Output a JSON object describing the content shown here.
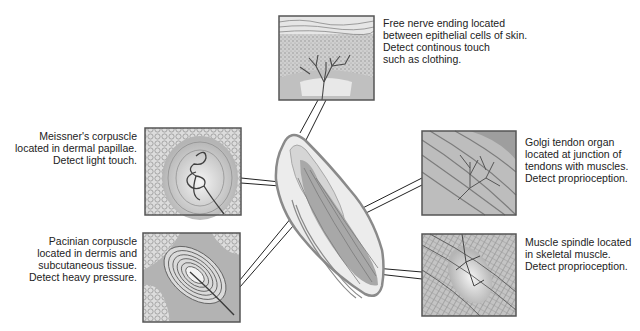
{
  "figure": {
    "receptors": [
      {
        "id": "free-nerve-ending",
        "label": "Free nerve ending located\nbetween epithelial cells of skin.\nDetect continous touch\nsuch as clothing."
      },
      {
        "id": "meissners-corpuscle",
        "label": "Meissner's corpuscle\nlocated in dermal papillae.\nDetect light touch."
      },
      {
        "id": "pacinian-corpuscle",
        "label": "Pacinian corpuscle\nlocated in dermis and\nsubcutaneous tissue.\nDetect heavy pressure."
      },
      {
        "id": "golgi-tendon-organ",
        "label": "Golgi tendon organ\nlocated at junction of\ntendons with muscles.\nDetect proprioception."
      },
      {
        "id": "muscle-spindle",
        "label": "Muscle spindle located\nin skeletal muscle.\nDetect proprioception."
      }
    ],
    "colors": {
      "panel_border": "#555555",
      "tissue_light": "#d8d8d8",
      "tissue_mid": "#a8a8a8",
      "tissue_dark": "#6e6e6e",
      "nerve": "#444444",
      "finger_outline": "#8a8a8a"
    }
  }
}
